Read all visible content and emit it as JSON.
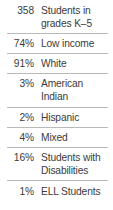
{
  "table": {
    "rows": [
      {
        "value": "358",
        "label": "Students in\ngrades K–5"
      },
      {
        "value": "74%",
        "label": "Low income"
      },
      {
        "value": "91%",
        "label": "White"
      },
      {
        "value": "3%",
        "label": "American\nIndian"
      },
      {
        "value": "2%",
        "label": "Hispanic"
      },
      {
        "value": "4%",
        "label": "Mixed"
      },
      {
        "value": "16%",
        "label": "Students with\nDisabilities"
      },
      {
        "value": "1%",
        "label": "ELL Students"
      }
    ]
  },
  "colors": {
    "text": "#3b3b3b",
    "rule": "#b9b9b9",
    "background": "#ffffff"
  }
}
